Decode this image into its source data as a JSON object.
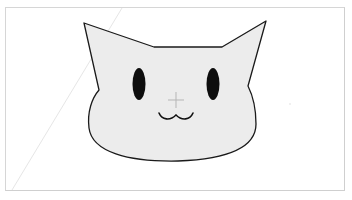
{
  "canvas": {
    "background": "#ffffff",
    "frame_border": "#d6d6d6"
  },
  "drawing": {
    "subject": "cat-face",
    "fill": "#ececec",
    "stroke": "#1a1a1a",
    "eye_color": "#0d0d0d",
    "guide_line_color": "#e4e4e4"
  },
  "cursor": {
    "type": "crosshair",
    "x": 176,
    "y": 100,
    "color": "#b5b5b5"
  }
}
